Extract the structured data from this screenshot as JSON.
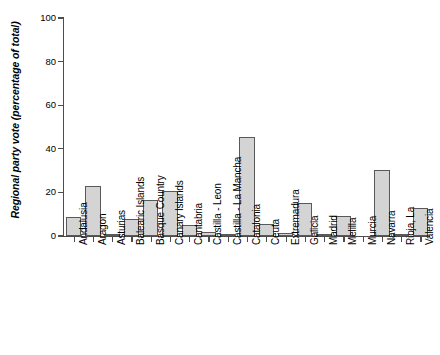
{
  "chart_data": {
    "type": "bar",
    "title": "",
    "xlabel": "",
    "ylabel": "Regional party vote (percentage of total)",
    "ylim": [
      0,
      100
    ],
    "yticks": [
      0,
      20,
      40,
      60,
      80,
      100
    ],
    "grid": false,
    "legend": null,
    "categories": [
      "Andalusia",
      "Aragon",
      "Asturias",
      "Balearic Islands",
      "Basque Country",
      "Canary Islands",
      "Cantabria",
      "Castilla - Leon",
      "Castilla - La Mancha",
      "Catalonia",
      "Ceuta",
      "Extremadura",
      "Galicia",
      "Madrid",
      "Melilla",
      "Murcia",
      "Navarra",
      "Rioja, La",
      "Valencia"
    ],
    "values": [
      8.5,
      23,
      1,
      8,
      16.5,
      20.5,
      5,
      2,
      0.5,
      45.5,
      5.5,
      1.5,
      15,
      1,
      9,
      0,
      30.5,
      1,
      13
    ]
  }
}
